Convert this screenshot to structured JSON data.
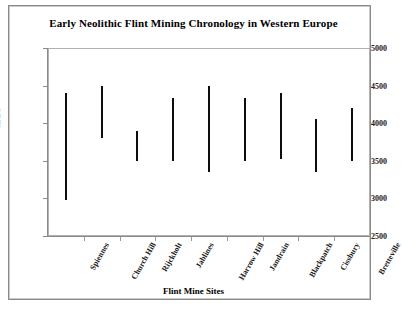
{
  "chart_data": {
    "type": "bar",
    "subtype": "range-bar",
    "title": "Early Neolithic Flint Mining Chronology in Western Europe",
    "xlabel": "Flint Mine Sites",
    "ylabel": "cal BC",
    "ylim": [
      2500,
      5000
    ],
    "yticks": [
      5000,
      4500,
      4000,
      3500,
      3000,
      2500
    ],
    "ytick_labels": [
      "5000",
      "4500",
      "4000",
      "3500",
      "3000",
      "2500"
    ],
    "grid": false,
    "legend": false,
    "categories": [
      "Spiennes",
      "Church Hill",
      "Rijckholt",
      "Jablines",
      "Harrow Hill",
      "Jandrain",
      "Blackpatch",
      "Cissbury",
      "Bretteville"
    ],
    "series": [
      {
        "name": "Date range",
        "kind": "range",
        "low": [
          2980,
          3800,
          3500,
          3500,
          3350,
          3500,
          3520,
          3350,
          3500
        ],
        "high": [
          4400,
          4500,
          3900,
          4330,
          4500,
          4330,
          4400,
          4050,
          4200
        ]
      }
    ],
    "bar_color": "#0d0d0d"
  },
  "axes": {
    "y_title": "cal BC",
    "x_title": "Flint Mine Sites"
  },
  "title": {
    "text": "Early Neolithic Flint Mining Chronology in Western Europe"
  }
}
